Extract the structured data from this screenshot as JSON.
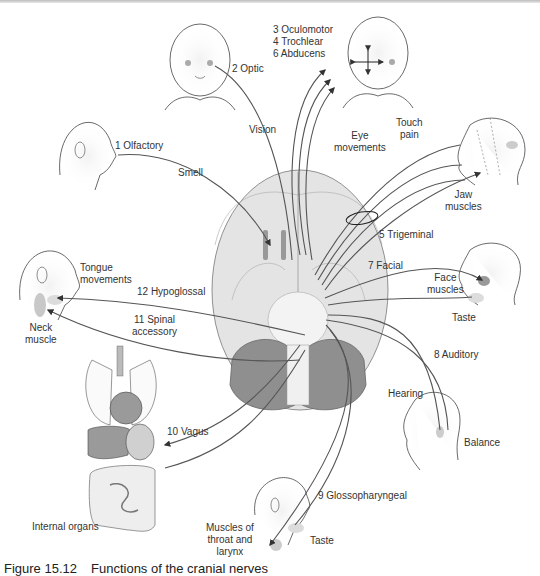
{
  "figure": {
    "number": "Figure 15.12",
    "title": "Functions of the cranial nerves"
  },
  "nerves": [
    {
      "id": "n1",
      "label": "1 Olfactory",
      "function": "Smell",
      "target": "Nose"
    },
    {
      "id": "n2",
      "label": "2 Optic",
      "function": "Vision",
      "target": "Eyes"
    },
    {
      "id": "n3",
      "label": "3 Oculomotor",
      "function": "Eye movements",
      "target": "Eye muscles"
    },
    {
      "id": "n4",
      "label": "4 Trochlear",
      "function": "Eye movements",
      "target": "Eye muscles"
    },
    {
      "id": "n5",
      "label": "5 Trigeminal",
      "function": "Touch pain",
      "target": "Face; Jaw muscles"
    },
    {
      "id": "n6",
      "label": "6 Abducens",
      "function": "Eye movements",
      "target": "Eye muscles"
    },
    {
      "id": "n7",
      "label": "7 Facial",
      "function": "Face muscles; Taste",
      "target": "Face"
    },
    {
      "id": "n8",
      "label": "8 Auditory",
      "function": "Hearing; Balance",
      "target": "Ear"
    },
    {
      "id": "n9",
      "label": "9 Glossopharyngeal",
      "function": "Taste; Muscles of throat and larynx",
      "target": "Throat"
    },
    {
      "id": "n10",
      "label": "10 Vagus",
      "function": "Internal organs",
      "target": "Internal organs"
    },
    {
      "id": "n11",
      "label": "11 Spinal accessory",
      "function": "Neck muscle",
      "target": "Neck"
    },
    {
      "id": "n12",
      "label": "12 Hypoglossal",
      "function": "Tongue movements",
      "target": "Tongue"
    }
  ],
  "labels": {
    "olfactory": "1 Olfactory",
    "smell": "Smell",
    "optic": "2 Optic",
    "vision": "Vision",
    "eye_nerves": "3 Oculomotor\n4 Trochlear\n6 Abducens",
    "eye_movements": "Eye\nmovements",
    "touch_pain": "Touch\npain",
    "jaw_muscles": "Jaw\nmuscles",
    "trigeminal": "5 Trigeminal",
    "facial": "7 Facial",
    "face_muscles": "Face\nmuscles",
    "taste_face": "Taste",
    "auditory": "8 Auditory",
    "hearing": "Hearing",
    "balance": "Balance",
    "glossopharyngeal": "9 Glossopharyngeal",
    "taste_throat": "Taste",
    "throat_muscles": "Muscles of\nthroat and\nlarynx",
    "vagus": "10 Vagus",
    "internal_organs": "Internal organs",
    "spinal_accessory": "11 Spinal\naccessory",
    "hypoglossal": "12 Hypoglossal",
    "tongue_movements": "Tongue\nmovements",
    "neck_muscle": "Neck\nmuscle"
  },
  "colors": {
    "line": "#555555",
    "brain_fill": "#e6e6e6",
    "cerebellum": "#8f8f8f",
    "skin_shade": "#d9d9d9",
    "organ_dark": "#9a9a9a",
    "organ_light": "#d0d0d0"
  }
}
